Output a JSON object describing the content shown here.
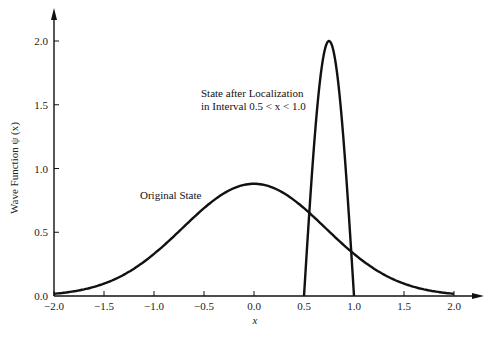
{
  "chart_data": {
    "type": "line",
    "title": "",
    "xlabel": "x",
    "ylabel": "Wave Function ψ (x)",
    "xlim": [
      -2.0,
      2.0
    ],
    "ylim": [
      0.0,
      2.0
    ],
    "grid": false,
    "x_ticks": [
      "−2.0",
      "−1.5",
      "−1.0",
      "−0.5",
      "0.0",
      "0.5",
      "1.0",
      "1.5",
      "2.0"
    ],
    "y_ticks": [
      "0.0",
      "0.5",
      "1.0",
      "1.5",
      "2.0"
    ],
    "series": [
      {
        "name": "Original State",
        "x": [
          -2.0,
          -1.75,
          -1.5,
          -1.25,
          -1.0,
          -0.75,
          -0.5,
          -0.25,
          0.0,
          0.25,
          0.5,
          0.75,
          1.0,
          1.25,
          1.5,
          1.75,
          2.0
        ],
        "values": [
          0.02,
          0.04,
          0.1,
          0.19,
          0.33,
          0.5,
          0.69,
          0.83,
          0.88,
          0.83,
          0.69,
          0.5,
          0.33,
          0.19,
          0.1,
          0.04,
          0.02
        ]
      },
      {
        "name": "State after Localization in Interval 0.5 < x < 1.0",
        "x": [
          0.5,
          0.55,
          0.6,
          0.65,
          0.7,
          0.75,
          0.8,
          0.85,
          0.9,
          0.95,
          1.0
        ],
        "values": [
          0.0,
          0.62,
          1.18,
          1.62,
          1.9,
          2.0,
          1.9,
          1.62,
          1.18,
          0.62,
          0.0
        ]
      }
    ],
    "annotations": [
      {
        "text": "Original State",
        "near_x": -0.6,
        "near_y": 0.68
      },
      {
        "text_line1": "State after Localization",
        "text_line2": "in Interval 0.5 < x < 1.0",
        "near_x": 0.55,
        "near_y": 1.55
      }
    ]
  },
  "labels": {
    "ylabel": "Wave Function ψ (x)",
    "xlabel": "x",
    "original": "Original State",
    "localized_line1": "State after Localization",
    "localized_line2": "in Interval 0.5 < x < 1.0"
  }
}
